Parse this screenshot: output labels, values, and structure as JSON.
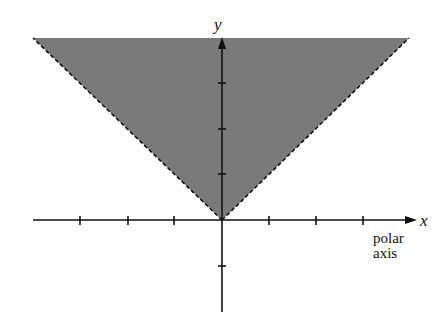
{
  "diagram": {
    "type": "polar-region",
    "colors": {
      "fill": "#7a7a7a",
      "boundary": "#111111",
      "axis": "#111111",
      "background": "#ffffff"
    },
    "axes": {
      "x_label": "x",
      "y_label": "y",
      "polar_axis_label_line1": "polar",
      "polar_axis_label_line2": "axis",
      "x_ticks_left": 3,
      "x_ticks_right": 3,
      "y_ticks_positive": 3,
      "y_ticks_negative": 1
    },
    "region": {
      "boundary_style": "dashed",
      "ray_angles_deg": [
        45,
        135
      ],
      "shaded": "between the rays, above origin"
    }
  }
}
